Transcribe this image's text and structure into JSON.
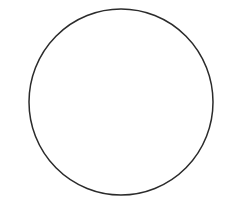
{
  "canvas": {
    "width": 226,
    "height": 207,
    "background_color": "#ffffff",
    "title": ""
  },
  "figure": {
    "name": "circle-outline",
    "shape_type": "circle",
    "center_x": 121,
    "center_y": 102,
    "radius_x": 92,
    "radius_y": 93,
    "diameter": 185,
    "stroke_color": "#2b2b2b",
    "stroke_width": 1.5,
    "fill_color": "#ffffff",
    "bounds": {
      "left": 29,
      "top": 9,
      "right": 213,
      "bottom": 195
    }
  },
  "labels": {
    "caption": "",
    "annotation": ""
  }
}
